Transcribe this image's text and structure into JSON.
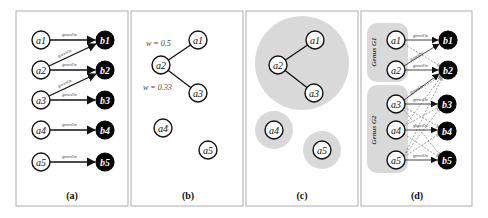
{
  "edge_label": "growsOn",
  "colors": {
    "source_node_fill": "#ffffff",
    "target_node_fill": "#000000",
    "cluster_fill": "#d9d9d9",
    "panel_border": "#9a9a9a"
  },
  "panels": {
    "a": {
      "caption": "(a)",
      "sources": [
        "a1",
        "a2",
        "a3",
        "a4",
        "a5"
      ],
      "targets": [
        "b1",
        "b2",
        "b3",
        "b4",
        "b5"
      ],
      "edges": [
        [
          "a1",
          "b1"
        ],
        [
          "a2",
          "b1"
        ],
        [
          "a2",
          "b2"
        ],
        [
          "a3",
          "b2"
        ],
        [
          "a3",
          "b3"
        ],
        [
          "a4",
          "b4"
        ],
        [
          "a5",
          "b5"
        ]
      ]
    },
    "b": {
      "caption": "(b)",
      "nodes": [
        "a1",
        "a2",
        "a3",
        "a4",
        "a5"
      ],
      "weights": [
        {
          "from": "a2",
          "to": "a1",
          "label": "w = 0.5"
        },
        {
          "from": "a2",
          "to": "a3",
          "label": "w = 0.33"
        }
      ]
    },
    "c": {
      "caption": "(c)",
      "nodes": [
        "a1",
        "a2",
        "a3",
        "a4",
        "a5"
      ],
      "clusters": [
        [
          "a1",
          "a2",
          "a3"
        ],
        [
          "a4"
        ],
        [
          "a5"
        ]
      ]
    },
    "d": {
      "caption": "(d)",
      "sources": [
        "a1",
        "a2",
        "a3",
        "a4",
        "a5"
      ],
      "targets": [
        "b1",
        "b2",
        "b3",
        "b4",
        "b5"
      ],
      "genus_groups": [
        {
          "label": "Genus G1",
          "members": [
            "a1",
            "a2"
          ]
        },
        {
          "label": "Genus G2",
          "members": [
            "a3",
            "a4",
            "a5"
          ]
        }
      ]
    }
  }
}
